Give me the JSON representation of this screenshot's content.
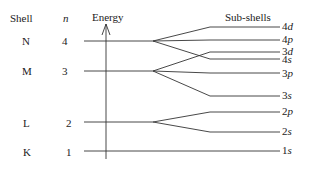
{
  "headers": {
    "shell": "Shell",
    "n": "n",
    "energy": "Energy",
    "subshells": "Sub-shells"
  },
  "shells": [
    {
      "name": "N",
      "n": "4",
      "y": 41
    },
    {
      "name": "M",
      "n": "3",
      "y": 71
    },
    {
      "name": "L",
      "n": "2",
      "y": 122
    },
    {
      "name": "K",
      "n": "1",
      "y": 152
    }
  ],
  "subshells": [
    {
      "num": "4",
      "letter": "d",
      "y": 27
    },
    {
      "num": "4",
      "letter": "p",
      "y": 40
    },
    {
      "num": "3",
      "letter": "d",
      "y": 52
    },
    {
      "num": "4",
      "letter": "s",
      "y": 60
    },
    {
      "num": "3",
      "letter": "p",
      "y": 74
    },
    {
      "num": "3",
      "letter": "s",
      "y": 96
    },
    {
      "num": "2",
      "letter": "p",
      "y": 112
    },
    {
      "num": "2",
      "letter": "s",
      "y": 132
    },
    {
      "num": "1",
      "letter": "s",
      "y": 150
    }
  ],
  "line_color": "#333333"
}
